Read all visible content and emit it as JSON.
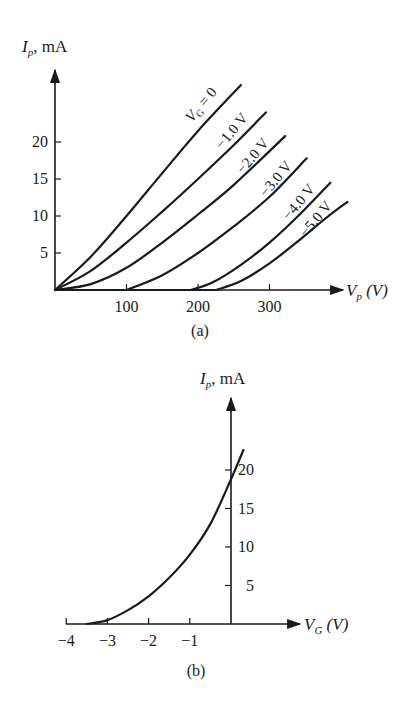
{
  "chart_data": [
    {
      "id": "a",
      "type": "line",
      "caption": "(a)",
      "title": "",
      "ylabel": "I_p, mA",
      "ylabel_main": "I",
      "ylabel_sub": "p",
      "ylabel_unit": ", mA",
      "xlabel": "V_p (V)",
      "xlabel_main": "V",
      "xlabel_sub": "p",
      "xlabel_unit": " (V)",
      "xlim": [
        0,
        400
      ],
      "ylim": [
        0,
        30
      ],
      "xticks": [
        100,
        200,
        300
      ],
      "xtick_labels": [
        "100",
        "200",
        "300"
      ],
      "yticks": [
        5,
        10,
        15,
        20
      ],
      "ytick_labels": [
        "5",
        "10",
        "15",
        "20"
      ],
      "grid": false,
      "legend": "inline labels along curves",
      "series": [
        {
          "name": "V_G = 0",
          "label_main": "V",
          "label_sub": "G",
          "label_rest": " = 0",
          "x": [
            0,
            50,
            100,
            150,
            200,
            260
          ],
          "y": [
            0,
            4.5,
            10,
            15.8,
            21.5,
            27.7
          ]
        },
        {
          "name": "-1.0 V",
          "label": "−1.0 V",
          "x": [
            0,
            50,
            100,
            150,
            200,
            250,
            295
          ],
          "y": [
            0,
            2.6,
            6.4,
            10.6,
            15.0,
            19.6,
            24.0
          ]
        },
        {
          "name": "-2.0 V",
          "label": "−2.0 V",
          "x": [
            0,
            50,
            100,
            150,
            200,
            250,
            322
          ],
          "y": [
            0,
            0.8,
            3.0,
            6.4,
            10.2,
            14.2,
            20.8
          ]
        },
        {
          "name": "-3.0 V",
          "label": "−3.0 V",
          "x": [
            0,
            100,
            150,
            200,
            250,
            300,
            352
          ],
          "y": [
            0,
            0,
            2.0,
            5.0,
            8.6,
            12.6,
            17.8
          ]
        },
        {
          "name": "-4.0 V",
          "label": "−4.0 V",
          "x": [
            0,
            190,
            220,
            260,
            300,
            340,
            385
          ],
          "y": [
            0,
            0,
            1.0,
            3.4,
            6.4,
            10.0,
            14.5
          ]
        },
        {
          "name": "-5.0 V",
          "label": "−5.0 V",
          "x": [
            0,
            225,
            260,
            300,
            340,
            380,
            409
          ],
          "y": [
            0,
            0,
            1.2,
            3.6,
            6.6,
            9.8,
            11.9
          ]
        }
      ]
    },
    {
      "id": "b",
      "type": "line",
      "caption": "(b)",
      "title": "",
      "ylabel": "I_p, mA",
      "ylabel_main": "I",
      "ylabel_sub": "p",
      "ylabel_unit": ", mA",
      "xlabel": "V_G (V)",
      "xlabel_main": "V",
      "xlabel_sub": "G",
      "xlabel_unit": " (V)",
      "xlim": [
        -4,
        0.6
      ],
      "ylim": [
        0,
        30
      ],
      "xticks": [
        -4,
        -3,
        -2,
        -1
      ],
      "xtick_labels": [
        "−4",
        "−3",
        "−2",
        "−1"
      ],
      "yticks": [
        5,
        10,
        15,
        20
      ],
      "ytick_labels": [
        "5",
        "10",
        "15",
        "20"
      ],
      "grid": false,
      "series": [
        {
          "name": "transfer characteristic",
          "x": [
            -3.5,
            -3.0,
            -2.5,
            -2.0,
            -1.5,
            -1.0,
            -0.5,
            0.0,
            0.3
          ],
          "y": [
            0,
            0.5,
            1.8,
            3.6,
            6.0,
            9.0,
            13.0,
            18.8,
            22.6
          ]
        }
      ]
    }
  ]
}
